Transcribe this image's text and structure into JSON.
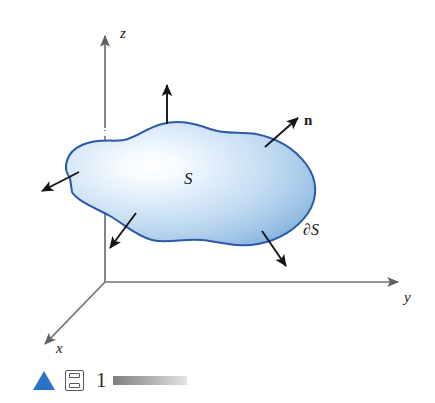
{
  "figure": {
    "type": "math-diagram-3d-surface"
  },
  "axes": {
    "z": {
      "label": "z",
      "name": "z-axis"
    },
    "y": {
      "label": "y",
      "name": "y-axis"
    },
    "x": {
      "label": "x",
      "name": "x-axis"
    },
    "origin": {
      "x": 105,
      "y": 282
    },
    "color": "#6e7175"
  },
  "surface": {
    "label": "S",
    "boundary_label": "∂S",
    "outline_color": "#2a5aa8",
    "fill_light": "#f2f8fd",
    "fill_mid": "#bcd8f0",
    "fill_dark": "#7fb0db"
  },
  "normal_vector": {
    "label": "n",
    "color": "#151515",
    "count": 5
  },
  "hidden_axis": {
    "style": "dashed",
    "color": "#8a8d91"
  },
  "footer": {
    "play_label": "play",
    "frame_icon_label": "frame",
    "frame_number": "1",
    "scrub_label": "timeline"
  }
}
